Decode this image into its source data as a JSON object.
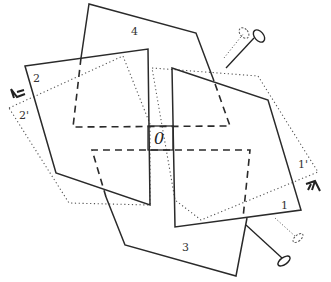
{
  "diagram": {
    "type": "folding/rotation panels diagram",
    "labels": {
      "center": "0",
      "panel1": "1",
      "panel1_prime": "1'",
      "panel2": "2",
      "panel2_prime": "2'",
      "panel3": "3",
      "panel4": "4"
    },
    "icons": {
      "rotate_arrow_left": "rotate-arrow-icon",
      "rotate_arrow_right": "rotate-arrow-icon",
      "pin_top": "pin-icon",
      "pin_bottom": "pin-icon"
    },
    "colors": {
      "line": "#2a2a2a",
      "dotted": "#555555",
      "background": "#ffffff"
    }
  }
}
